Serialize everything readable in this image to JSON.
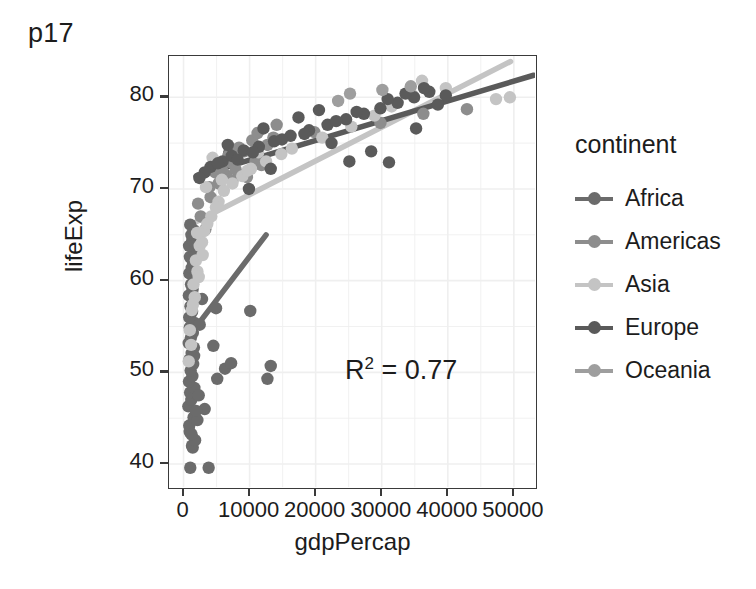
{
  "chart_data": {
    "type": "scatter",
    "title": "p17",
    "xlabel": "gdpPercap",
    "ylabel": "lifeExp",
    "xlim": [
      -2200,
      53200
    ],
    "ylim": [
      37.5,
      84.5
    ],
    "xticks": [
      0,
      10000,
      20000,
      30000,
      40000,
      50000
    ],
    "xtick_labels": [
      "0",
      "10000",
      "20000",
      "30000",
      "40000",
      "50000"
    ],
    "yticks": [
      40,
      50,
      60,
      70,
      80
    ],
    "ytick_labels": [
      "40",
      "50",
      "60",
      "70",
      "80"
    ],
    "grid": true,
    "legend_position": "right",
    "legend_title": "continent",
    "annotations": [
      {
        "text": "R2 = 0.77",
        "display": "R",
        "sup": "2",
        "rest": " = 0.77",
        "x": 24000,
        "y": 51.5
      }
    ],
    "series": [
      {
        "name": "Africa",
        "color": "#6b6b6b",
        "trendline": {
          "x": [
            1100,
            12500
          ],
          "y": [
            54.2,
            65.0
          ]
        },
        "points": [
          [
            1280,
            42.0
          ],
          [
            940,
            43.5
          ],
          [
            1020,
            39.6
          ],
          [
            1390,
            41.8
          ],
          [
            860,
            44.2
          ],
          [
            1520,
            45.1
          ],
          [
            730,
            46.3
          ],
          [
            1180,
            47.0
          ],
          [
            990,
            47.8
          ],
          [
            1640,
            48.3
          ],
          [
            820,
            49.0
          ],
          [
            1340,
            49.6
          ],
          [
            1080,
            50.2
          ],
          [
            1460,
            50.9
          ],
          [
            900,
            51.4
          ],
          [
            1230,
            52.1
          ],
          [
            1570,
            52.7
          ],
          [
            780,
            53.2
          ],
          [
            1120,
            53.8
          ],
          [
            1400,
            54.3
          ],
          [
            950,
            54.9
          ],
          [
            1680,
            55.4
          ],
          [
            860,
            56.0
          ],
          [
            1290,
            56.6
          ],
          [
            1050,
            57.2
          ],
          [
            1510,
            57.8
          ],
          [
            810,
            58.4
          ],
          [
            1360,
            59.0
          ],
          [
            1140,
            59.6
          ],
          [
            1590,
            60.2
          ],
          [
            880,
            60.8
          ],
          [
            1240,
            61.4
          ],
          [
            1430,
            62.0
          ],
          [
            960,
            62.6
          ],
          [
            1700,
            63.2
          ],
          [
            840,
            63.8
          ],
          [
            1320,
            64.4
          ],
          [
            1190,
            65.0
          ],
          [
            1550,
            65.5
          ],
          [
            1010,
            66.1
          ],
          [
            4510,
            52.9
          ],
          [
            5100,
            49.3
          ],
          [
            6280,
            50.4
          ],
          [
            7200,
            51.0
          ],
          [
            4920,
            57.0
          ],
          [
            3200,
            46.0
          ],
          [
            3800,
            39.6
          ],
          [
            2450,
            55.2
          ],
          [
            2100,
            44.8
          ],
          [
            12700,
            49.3
          ],
          [
            13200,
            50.7
          ],
          [
            10100,
            56.7
          ],
          [
            2800,
            58.0
          ],
          [
            5400,
            72.3
          ],
          [
            6900,
            73.9
          ],
          [
            1750,
            42.6
          ],
          [
            1230,
            43.2
          ],
          [
            1890,
            45.8
          ],
          [
            2300,
            47.5
          ],
          [
            1600,
            51.8
          ]
        ]
      },
      {
        "name": "Americas",
        "color": "#8d8d8d",
        "trendline": null,
        "points": [
          [
            4330,
            72.4
          ],
          [
            5680,
            71.0
          ],
          [
            7200,
            72.9
          ],
          [
            6450,
            71.5
          ],
          [
            8100,
            73.2
          ],
          [
            9200,
            74.1
          ],
          [
            10400,
            75.3
          ],
          [
            11800,
            72.6
          ],
          [
            12700,
            74.8
          ],
          [
            3900,
            70.2
          ],
          [
            4800,
            71.8
          ],
          [
            5300,
            70.6
          ],
          [
            6800,
            73.6
          ],
          [
            7900,
            72.1
          ],
          [
            9600,
            71.3
          ],
          [
            13600,
            75.6
          ],
          [
            19800,
            76.2
          ],
          [
            29800,
            77.2
          ],
          [
            36300,
            78.2
          ],
          [
            42900,
            78.7
          ],
          [
            2600,
            67.0
          ],
          [
            3300,
            65.6
          ],
          [
            2200,
            68.4
          ],
          [
            8400,
            74.5
          ],
          [
            11200,
            76.1
          ],
          [
            5900,
            72.0
          ],
          [
            7400,
            70.9
          ],
          [
            10900,
            73.0
          ],
          [
            14100,
            77.0
          ],
          [
            4100,
            69.1
          ]
        ]
      },
      {
        "name": "Asia",
        "color": "#c4c4c4",
        "trendline": {
          "x": [
            1600,
            49500
          ],
          "y": [
            66.3,
            83.9
          ]
        },
        "points": [
          [
            2450,
            63.8
          ],
          [
            1870,
            62.2
          ],
          [
            3100,
            65.4
          ],
          [
            4200,
            67.0
          ],
          [
            5300,
            68.6
          ],
          [
            2100,
            61.0
          ],
          [
            1500,
            59.6
          ],
          [
            2800,
            64.2
          ],
          [
            6100,
            69.8
          ],
          [
            7400,
            70.6
          ],
          [
            8900,
            71.4
          ],
          [
            10200,
            72.2
          ],
          [
            12500,
            73.0
          ],
          [
            14800,
            73.8
          ],
          [
            2300,
            60.4
          ],
          [
            1700,
            58.2
          ],
          [
            3600,
            66.2
          ],
          [
            4900,
            68.0
          ],
          [
            21000,
            75.6
          ],
          [
            25400,
            76.8
          ],
          [
            28900,
            78.0
          ],
          [
            31500,
            79.0
          ],
          [
            34700,
            80.2
          ],
          [
            39700,
            81.0
          ],
          [
            47300,
            79.8
          ],
          [
            49400,
            80.0
          ],
          [
            1250,
            56.8
          ],
          [
            950,
            54.6
          ],
          [
            1420,
            57.4
          ],
          [
            2900,
            62.8
          ],
          [
            3400,
            70.2
          ],
          [
            5800,
            71.0
          ],
          [
            9700,
            72.0
          ],
          [
            16400,
            74.4
          ],
          [
            36100,
            81.8
          ],
          [
            2050,
            65.2
          ],
          [
            1150,
            53.0
          ],
          [
            790,
            51.2
          ],
          [
            4400,
            73.4
          ],
          [
            11300,
            74.0
          ]
        ]
      },
      {
        "name": "Europe",
        "color": "#5a5a5a",
        "trendline": {
          "x": [
            1900,
            53000
          ],
          "y": [
            71.4,
            82.4
          ]
        },
        "points": [
          [
            5900,
            73.0
          ],
          [
            7300,
            73.6
          ],
          [
            9100,
            74.2
          ],
          [
            11400,
            74.6
          ],
          [
            13700,
            75.2
          ],
          [
            16200,
            75.8
          ],
          [
            19000,
            76.4
          ],
          [
            21800,
            77.0
          ],
          [
            24600,
            77.6
          ],
          [
            27300,
            78.2
          ],
          [
            29800,
            78.8
          ],
          [
            32400,
            79.4
          ],
          [
            34900,
            80.0
          ],
          [
            37200,
            80.6
          ],
          [
            39700,
            80.2
          ],
          [
            4100,
            72.4
          ],
          [
            3200,
            71.8
          ],
          [
            2400,
            71.2
          ],
          [
            8200,
            73.2
          ],
          [
            10500,
            74.0
          ],
          [
            14900,
            75.4
          ],
          [
            18300,
            76.0
          ],
          [
            23100,
            77.4
          ],
          [
            26200,
            78.4
          ],
          [
            30900,
            79.8
          ],
          [
            33600,
            80.4
          ],
          [
            36400,
            81.0
          ],
          [
            28400,
            74.1
          ],
          [
            31100,
            72.9
          ],
          [
            25100,
            73.0
          ],
          [
            5200,
            72.8
          ],
          [
            6700,
            74.8
          ],
          [
            12100,
            76.6
          ],
          [
            17400,
            77.8
          ],
          [
            20500,
            78.6
          ],
          [
            38500,
            79.2
          ],
          [
            35200,
            76.6
          ],
          [
            22400,
            75.0
          ],
          [
            9900,
            70.0
          ],
          [
            13200,
            72.2
          ]
        ]
      },
      {
        "name": "Oceania",
        "color": "#9e9e9e",
        "trendline": null,
        "points": [
          [
            34400,
            81.2
          ],
          [
            25200,
            80.4
          ],
          [
            30100,
            80.8
          ],
          [
            23400,
            79.6
          ]
        ]
      }
    ]
  },
  "chart": {
    "title": "p17",
    "axis": {
      "x_title": "gdpPercap",
      "y_title": "lifeExp",
      "x_ticks": [
        "0",
        "10000",
        "20000",
        "30000",
        "40000",
        "50000"
      ],
      "y_ticks": [
        "80",
        "70",
        "60",
        "50",
        "40"
      ]
    },
    "annotation": {
      "base": "R",
      "exponent": "2",
      "tail": " = 0.77",
      "full": "R2 = 0.77"
    }
  },
  "legend": {
    "title": "continent",
    "items": [
      {
        "label": "Africa",
        "color": "#6b6b6b"
      },
      {
        "label": "Americas",
        "color": "#8d8d8d"
      },
      {
        "label": "Asia",
        "color": "#c4c4c4"
      },
      {
        "label": "Europe",
        "color": "#5a5a5a"
      },
      {
        "label": "Oceania",
        "color": "#9e9e9e"
      }
    ]
  },
  "colors": {
    "panel_background": "#ffffff",
    "panel_border": "#3a3a3a",
    "gridline": "#efefef",
    "text": "#1c1c1c"
  }
}
